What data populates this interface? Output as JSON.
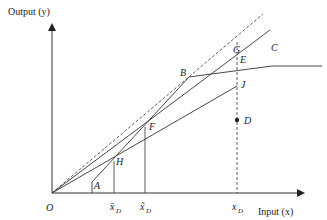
{
  "diagram": {
    "y_axis_label": "Output (y)",
    "x_axis_label": "Input (x)",
    "origin_label": "O",
    "points": {
      "A": "A",
      "B": "B",
      "C": "C",
      "D": "D",
      "E": "E",
      "F": "F",
      "G": "G",
      "H": "H",
      "J": "J"
    },
    "x_ticks": {
      "xbar": "x̄",
      "xtilde": "x̃",
      "x": "x",
      "subscript": "D"
    },
    "colors": {
      "line": "#333333",
      "background": "#ffffff"
    }
  }
}
